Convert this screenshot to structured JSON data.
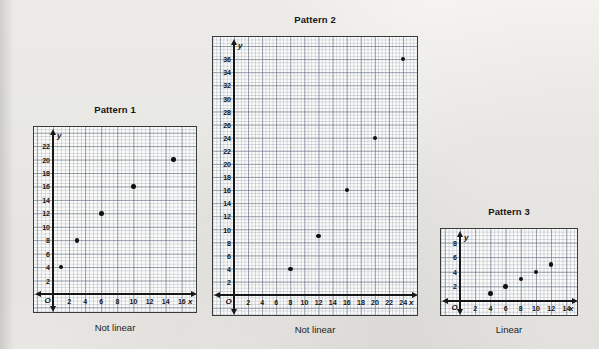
{
  "page": {
    "background_color": "#f2f1ee",
    "ink_color": "#111111"
  },
  "chart_data": [
    {
      "type": "scatter",
      "title": "Pattern 1",
      "caption": "Not linear",
      "xlabel": "x",
      "ylabel": "y",
      "xlim": [
        0,
        18
      ],
      "ylim": [
        0,
        24
      ],
      "xticks": [
        2,
        4,
        6,
        8,
        10,
        12,
        14,
        16
      ],
      "yticks": [
        2,
        4,
        6,
        8,
        10,
        12,
        14,
        16,
        18,
        20,
        22
      ],
      "origin_label": "O",
      "grid": true,
      "points": [
        {
          "x": 1,
          "y": 4
        },
        {
          "x": 3,
          "y": 8
        },
        {
          "x": 6,
          "y": 12
        },
        {
          "x": 10,
          "y": 16
        },
        {
          "x": 15,
          "y": 20
        }
      ]
    },
    {
      "type": "scatter",
      "title": "Pattern 2",
      "caption": "Not linear",
      "xlabel": "x",
      "ylabel": "y",
      "xlim": [
        0,
        26
      ],
      "ylim": [
        0,
        37
      ],
      "xticks": [
        2,
        4,
        6,
        8,
        10,
        12,
        14,
        16,
        18,
        20,
        22,
        24
      ],
      "yticks": [
        2,
        4,
        6,
        8,
        10,
        12,
        14,
        16,
        18,
        20,
        22,
        24,
        26,
        28,
        30,
        32,
        34,
        36
      ],
      "origin_label": "O",
      "grid": true,
      "points": [
        {
          "x": 8,
          "y": 4
        },
        {
          "x": 12,
          "y": 9
        },
        {
          "x": 16,
          "y": 16
        },
        {
          "x": 20,
          "y": 24
        },
        {
          "x": 24,
          "y": 36
        }
      ]
    },
    {
      "type": "scatter",
      "title": "Pattern 3",
      "caption": "Linear",
      "xlabel": "x",
      "ylabel": "y",
      "xlim": [
        0,
        16
      ],
      "ylim": [
        0,
        10
      ],
      "xticks": [
        2,
        4,
        6,
        8,
        10,
        12,
        14
      ],
      "yticks": [
        2,
        4,
        6,
        8
      ],
      "origin_label": "O",
      "grid": true,
      "points": [
        {
          "x": 4,
          "y": 1
        },
        {
          "x": 6,
          "y": 2
        },
        {
          "x": 8,
          "y": 3
        },
        {
          "x": 10,
          "y": 4
        },
        {
          "x": 12,
          "y": 5
        }
      ]
    }
  ]
}
